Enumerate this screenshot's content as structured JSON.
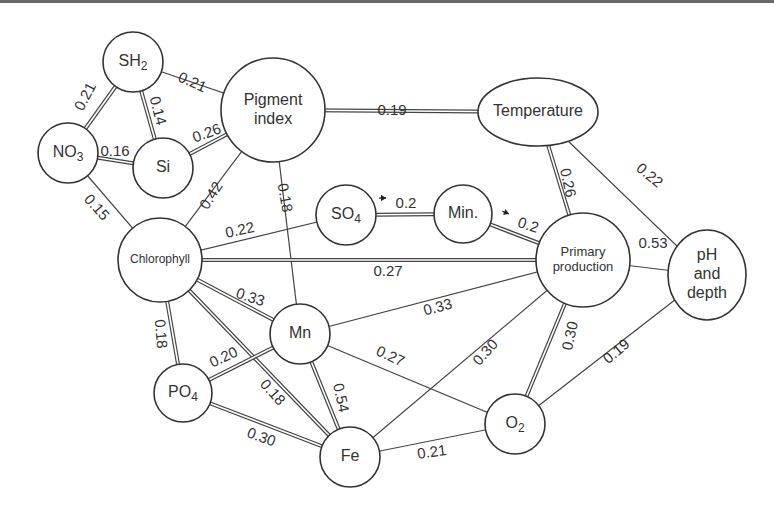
{
  "diagram": {
    "type": "correlation-network",
    "nodes": [
      {
        "id": "SH2",
        "label": "SH",
        "sub": "2",
        "cx": 133,
        "cy": 62,
        "rx": 30,
        "ry": 30,
        "font": 16
      },
      {
        "id": "Pigment",
        "label_lines": [
          "Pigment",
          "index"
        ],
        "cx": 273,
        "cy": 110,
        "rx": 52,
        "ry": 52,
        "font": 16
      },
      {
        "id": "NO3",
        "label": "NO",
        "sub": "3",
        "cx": 68,
        "cy": 153,
        "rx": 30,
        "ry": 30,
        "font": 16
      },
      {
        "id": "Si",
        "label": "Si",
        "cx": 163,
        "cy": 168,
        "rx": 30,
        "ry": 30,
        "font": 16
      },
      {
        "id": "Temperature",
        "label": "Temperature",
        "cx": 538,
        "cy": 112,
        "rx": 60,
        "ry": 34,
        "font": 16
      },
      {
        "id": "Chlorophyll",
        "label": "Chlorophyll",
        "cx": 160,
        "cy": 260,
        "rx": 42,
        "ry": 42,
        "font": 12
      },
      {
        "id": "SO4",
        "label": "SO",
        "sub": "4",
        "cx": 346,
        "cy": 215,
        "rx": 30,
        "ry": 30,
        "font": 16
      },
      {
        "id": "Min",
        "label": "Min.",
        "cx": 463,
        "cy": 214,
        "rx": 29,
        "ry": 29,
        "font": 16
      },
      {
        "id": "Primary",
        "label_lines": [
          "Primary",
          "production"
        ],
        "cx": 583,
        "cy": 260,
        "rx": 47,
        "ry": 47,
        "font": 13
      },
      {
        "id": "pH",
        "label_lines": [
          "pH",
          "and",
          "depth"
        ],
        "cx": 707,
        "cy": 275,
        "rx": 39,
        "ry": 45,
        "font": 16
      },
      {
        "id": "Mn",
        "label": "Mn",
        "cx": 300,
        "cy": 334,
        "rx": 30,
        "ry": 30,
        "font": 16
      },
      {
        "id": "PO4",
        "label": "PO",
        "sub": "4",
        "cx": 183,
        "cy": 393,
        "rx": 29,
        "ry": 29,
        "font": 16
      },
      {
        "id": "Fe",
        "label": "Fe",
        "cx": 350,
        "cy": 457,
        "rx": 30,
        "ry": 30,
        "font": 16
      },
      {
        "id": "O2",
        "label": "O",
        "sub": "2",
        "cx": 515,
        "cy": 424,
        "rx": 30,
        "ry": 30,
        "font": 16
      }
    ],
    "edges": [
      {
        "from": "SH2",
        "to": "NO3",
        "value": "0.21",
        "style": "double",
        "lx": 86,
        "ly": 97,
        "rot": -62
      },
      {
        "from": "SH2",
        "to": "Si",
        "value": "0.14",
        "style": "double",
        "lx": 157,
        "ly": 111,
        "rot": 75
      },
      {
        "from": "SH2",
        "to": "Pigment",
        "value": "0.21",
        "style": "single",
        "lx": 192,
        "ly": 83,
        "rot": 24
      },
      {
        "from": "NO3",
        "to": "Si",
        "value": "0.16",
        "style": "double",
        "lx": 115,
        "ly": 152,
        "rot": 0
      },
      {
        "from": "Si",
        "to": "Pigment",
        "value": "0.26",
        "style": "double",
        "lx": 207,
        "ly": 134,
        "rot": -20
      },
      {
        "from": "NO3",
        "to": "Chlorophyll",
        "value": "0.15",
        "style": "single",
        "lx": 96,
        "ly": 208,
        "rot": 48
      },
      {
        "from": "Pigment",
        "to": "Chlorophyll",
        "value": "0.42",
        "style": "single",
        "lx": 212,
        "ly": 196,
        "rot": -58
      },
      {
        "from": "Pigment",
        "to": "Temperature",
        "value": "0.19",
        "style": "double",
        "lx": 392,
        "ly": 111,
        "rot": 0
      },
      {
        "from": "Pigment",
        "to": "Mn",
        "value": "0.18",
        "style": "single",
        "lx": 284,
        "ly": 198,
        "rot": 80
      },
      {
        "from": "Chlorophyll",
        "to": "SO4",
        "value": "0.22",
        "style": "single",
        "lx": 240,
        "ly": 231,
        "rot": -12
      },
      {
        "from": "SO4",
        "to": "Min",
        "value": "0.2",
        "style": "double",
        "lx": 406,
        "ly": 204,
        "rot": 0,
        "arrow": true
      },
      {
        "from": "Min",
        "to": "Primary",
        "value": "0.2",
        "style": "double",
        "lx": 528,
        "ly": 226,
        "rot": 18,
        "arrow": true
      },
      {
        "from": "Chlorophyll",
        "to": "Primary",
        "value": "0.27",
        "style": "double",
        "lx": 388,
        "ly": 272,
        "rot": 0
      },
      {
        "from": "Temperature",
        "to": "Primary",
        "value": "0.26",
        "style": "double",
        "lx": 567,
        "ly": 183,
        "rot": 78
      },
      {
        "from": "Temperature",
        "to": "pH",
        "value": "0.22",
        "style": "single",
        "lx": 649,
        "ly": 176,
        "rot": 40
      },
      {
        "from": "Primary",
        "to": "pH",
        "value": "0.53",
        "style": "single",
        "lx": 653,
        "ly": 244,
        "rot": 0
      },
      {
        "from": "Chlorophyll",
        "to": "Mn",
        "value": "0.33",
        "style": "double",
        "lx": 250,
        "ly": 298,
        "rot": 18
      },
      {
        "from": "Chlorophyll",
        "to": "PO4",
        "value": "0.18",
        "style": "double",
        "lx": 160,
        "ly": 334,
        "rot": 85
      },
      {
        "from": "Chlorophyll",
        "to": "Fe",
        "value": "0.18",
        "style": "double",
        "lx": 272,
        "ly": 393,
        "rot": 48
      },
      {
        "from": "Mn",
        "to": "PO4",
        "value": "0.20",
        "style": "double",
        "lx": 224,
        "ly": 358,
        "rot": -25
      },
      {
        "from": "Mn",
        "to": "Fe",
        "value": "0.54",
        "style": "double",
        "lx": 340,
        "ly": 398,
        "rot": 78
      },
      {
        "from": "PO4",
        "to": "Fe",
        "value": "0.30",
        "style": "double",
        "lx": 261,
        "ly": 438,
        "rot": 20
      },
      {
        "from": "Mn",
        "to": "Primary",
        "value": "0.33",
        "style": "single",
        "lx": 438,
        "ly": 308,
        "rot": -15
      },
      {
        "from": "Mn",
        "to": "O2",
        "value": "0.27",
        "style": "single",
        "lx": 390,
        "ly": 357,
        "rot": 25
      },
      {
        "from": "Fe",
        "to": "Primary",
        "value": "0.30",
        "style": "single",
        "lx": 486,
        "ly": 353,
        "rot": -48
      },
      {
        "from": "Primary",
        "to": "O2",
        "value": "0.30",
        "style": "double",
        "lx": 571,
        "ly": 336,
        "rot": -78
      },
      {
        "from": "pH",
        "to": "O2",
        "value": "0.19",
        "style": "single",
        "lx": 617,
        "ly": 352,
        "rot": -40
      },
      {
        "from": "Fe",
        "to": "O2",
        "value": "0.21",
        "style": "single",
        "lx": 432,
        "ly": 453,
        "rot": -8
      }
    ]
  }
}
